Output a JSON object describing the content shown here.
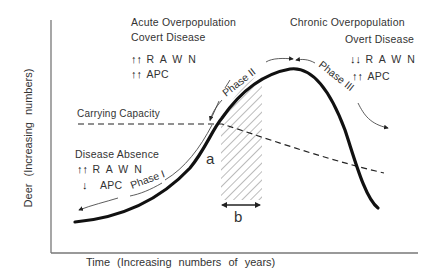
{
  "diagram": {
    "y_axis_label": "Deer (Increasing numbers)",
    "x_axis_label": "Time (Increasing numbers of years)",
    "carrying_capacity_label": "Carrying Capacity",
    "point_a_label": "a",
    "interval_b_label": "b",
    "phases": [
      "Phase I",
      "Phase II",
      "Phase III"
    ],
    "acute": {
      "title_line1": "Acute Overpopulation",
      "title_line2": "Covert Disease",
      "rawn_arrows": "↑↑",
      "rawn_label": "R A W N",
      "apc_arrows": "↑↑",
      "apc_label": "APC"
    },
    "chronic": {
      "title_line1": "Chronic Overpopulation",
      "title_line2": "Overt Disease",
      "rawn_arrows": "↓↓",
      "rawn_label": "R A W N",
      "apc_arrows": "↑↑",
      "apc_label": "APC"
    },
    "absence": {
      "title": "Disease Absence",
      "rawn_arrows": "↑↑",
      "rawn_label": "R A W N",
      "apc_arrows": "↓",
      "apc_label": "APC"
    },
    "colors": {
      "curve": "#111111",
      "carrying_capacity": "#222222",
      "hatch": "#666666",
      "axis": "#777777"
    }
  }
}
